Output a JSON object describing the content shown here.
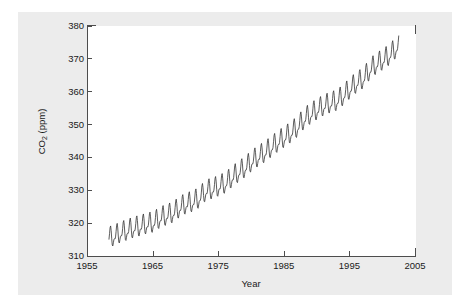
{
  "chart_data": {
    "type": "line",
    "title": "",
    "xlabel": "Year",
    "ylabel": "CO2 (ppm)",
    "ylabel_html": "CO<sub>2</sub> (ppm)",
    "xlim": [
      1955,
      2005
    ],
    "ylim": [
      310,
      380
    ],
    "xticks": [
      1955,
      1965,
      1975,
      1985,
      1995,
      2005
    ],
    "yticks": [
      310,
      320,
      330,
      340,
      350,
      360,
      370,
      380
    ],
    "grid": false,
    "legend": null,
    "line_color": "#333333",
    "line_width": 0.8,
    "background_color": "#ececec",
    "plot_background_color": "#ffffff",
    "axis_color": "#4d4d4d",
    "seasonal_amplitude_ppm": 3.0,
    "series": [
      {
        "name": "Monthly mean CO2",
        "x_start": 1958.2,
        "x_end": 2002.4,
        "samples_per_year": 12,
        "annual_mean_x": [
          1958,
          1959,
          1960,
          1961,
          1962,
          1963,
          1964,
          1965,
          1966,
          1967,
          1968,
          1969,
          1970,
          1971,
          1972,
          1973,
          1974,
          1975,
          1976,
          1977,
          1978,
          1979,
          1980,
          1981,
          1982,
          1983,
          1984,
          1985,
          1986,
          1987,
          1988,
          1989,
          1990,
          1991,
          1992,
          1993,
          1994,
          1995,
          1996,
          1997,
          1998,
          1999,
          2000,
          2001,
          2002
        ],
        "annual_mean_y": [
          315.3,
          315.9,
          316.9,
          317.6,
          318.4,
          318.9,
          319.6,
          320.0,
          321.4,
          322.2,
          323.0,
          324.6,
          325.7,
          326.3,
          327.5,
          329.7,
          330.2,
          331.1,
          332.0,
          333.8,
          335.4,
          336.8,
          338.7,
          340.1,
          341.4,
          343.0,
          344.6,
          346.0,
          347.4,
          349.2,
          351.6,
          353.1,
          354.4,
          355.6,
          356.4,
          357.1,
          358.8,
          360.8,
          362.6,
          363.8,
          366.6,
          368.3,
          369.5,
          371.0,
          373.1
        ]
      }
    ]
  },
  "figure": {
    "canvas_label": "chart-canvas"
  }
}
